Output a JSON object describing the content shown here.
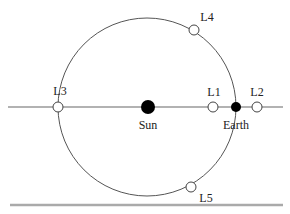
{
  "diagram": {
    "colors": {
      "orbit": "#555555",
      "axis": "#999999",
      "baseline": "#aaaaaa",
      "body": "#000000",
      "point_fill": "#ffffff"
    },
    "bodies": [
      {
        "id": "sun",
        "label": "Sun"
      },
      {
        "id": "earth",
        "label": "Earth"
      }
    ],
    "points": [
      {
        "id": "L1",
        "label": "L1"
      },
      {
        "id": "L2",
        "label": "L2"
      },
      {
        "id": "L3",
        "label": "L3"
      },
      {
        "id": "L4",
        "label": "L4"
      },
      {
        "id": "L5",
        "label": "L5"
      }
    ]
  }
}
